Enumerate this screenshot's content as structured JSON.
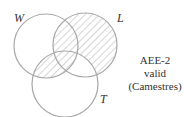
{
  "diagram": {
    "type": "venn",
    "circles": [
      {
        "label": "W",
        "cx": 46,
        "cy": 46,
        "r": 32
      },
      {
        "label": "L",
        "cx": 85,
        "cy": 45,
        "r": 32
      },
      {
        "label": "T",
        "cx": 65,
        "cy": 84,
        "r": 33
      }
    ],
    "shaded_regions": [
      "W∩L (not T)",
      "L only",
      "W∩T (not L)",
      "W∩L∩T"
    ],
    "note_lines": [
      "AEE-2",
      "valid",
      "(Camestres)"
    ],
    "colors": {
      "stroke": "#a8a8a8",
      "hatch": "#b0b0b0",
      "text": "#333333"
    }
  }
}
